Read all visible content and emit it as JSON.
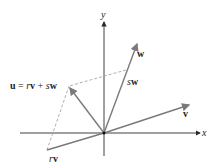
{
  "diagram": {
    "axes": {
      "x_label": "x",
      "y_label": "y"
    },
    "vectors": [
      {
        "name": "v",
        "label": "v"
      },
      {
        "name": "w",
        "label": "w"
      },
      {
        "name": "sw",
        "label_coef": "s",
        "label_vec": "w"
      },
      {
        "name": "rv",
        "label_coef": "r",
        "label_vec": "v"
      },
      {
        "name": "u",
        "label": "u = rv + sw"
      }
    ],
    "equation": {
      "lhs": "u",
      "eq": "=",
      "r": "r",
      "v": "v",
      "plus": "+",
      "s": "s",
      "w": "w"
    },
    "colors": {
      "axis": "#2a2a2a",
      "vector": "#7a7a7a",
      "dashed": "#9a9a9a",
      "text": "#222222"
    }
  }
}
